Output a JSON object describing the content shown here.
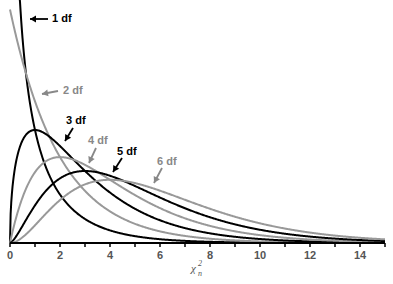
{
  "chart_data": {
    "type": "line",
    "title": "",
    "xlabel": "χ²_n",
    "ylabel": "",
    "xlim": [
      0,
      15
    ],
    "ylim": [
      0,
      0.52
    ],
    "grid": false,
    "x_ticks": [
      "0",
      "2",
      "4",
      "6",
      "8",
      "10",
      "12",
      "14"
    ],
    "series": [
      {
        "name": "1 df",
        "df": 1,
        "color": "#000000",
        "label_color": "#000000"
      },
      {
        "name": "2 df",
        "df": 2,
        "color": "#999999",
        "label_color": "#888888"
      },
      {
        "name": "3 df",
        "df": 3,
        "color": "#000000",
        "label_color": "#000000"
      },
      {
        "name": "4 df",
        "df": 4,
        "color": "#999999",
        "label_color": "#888888"
      },
      {
        "name": "5 df",
        "df": 5,
        "color": "#000000",
        "label_color": "#000000"
      },
      {
        "name": "6 df",
        "df": 6,
        "color": "#999999",
        "label_color": "#888888"
      }
    ],
    "annotations": [
      {
        "text": "1 df",
        "tx": 52,
        "ty": 22,
        "ax1": 48,
        "ay1": 19,
        "ax2": 30,
        "ay2": 19
      },
      {
        "text": "2 df",
        "tx": 63,
        "ty": 94,
        "ax1": 58,
        "ay1": 91,
        "ax2": 42,
        "ay2": 94
      },
      {
        "text": "3 df",
        "tx": 66,
        "ty": 124,
        "ax1": 73,
        "ay1": 128,
        "ax2": 65,
        "ay2": 141
      },
      {
        "text": "4 df",
        "tx": 88,
        "ty": 144,
        "ax1": 96,
        "ay1": 148,
        "ax2": 89,
        "ay2": 163
      },
      {
        "text": "5 df",
        "tx": 117,
        "ty": 155,
        "ax1": 122,
        "ay1": 158,
        "ax2": 113,
        "ay2": 172
      },
      {
        "text": "6 df",
        "tx": 157,
        "ty": 165,
        "ax1": 162,
        "ay1": 168,
        "ax2": 154,
        "ay2": 183
      }
    ]
  }
}
